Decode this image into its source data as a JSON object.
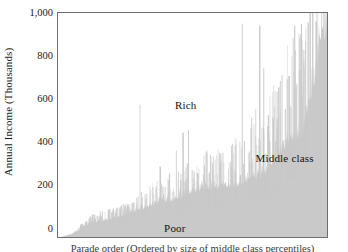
{
  "chart_data": {
    "type": "area",
    "title": "",
    "subtitle": "",
    "xlabel": "",
    "ylabel": "Annual Income (Thousands)",
    "ylim": [
      0,
      1050
    ],
    "yticks": [
      0,
      200,
      400,
      600,
      800,
      1000
    ],
    "ytick_labels": [
      "0",
      "200",
      "400",
      "600",
      "800",
      "1,000"
    ],
    "xlim": [
      0,
      100
    ],
    "xticks": [],
    "xtick_labels": [],
    "grid": false,
    "legend_position": "none",
    "series_fill_color": "#c9c9c9",
    "frame_color": "#6e6e6e",
    "annotations": [
      {
        "label": "Rich",
        "x_pct": 47.5,
        "y_value": 620
      },
      {
        "label": "Middle class",
        "x_pct": 84.0,
        "y_value": 370
      },
      {
        "label": "Poor",
        "x_pct": 43.5,
        "y_value": 45
      }
    ],
    "envelope": {
      "comment": "Upper silhouette of the shaded mass, sampled as (x_pct, income_thousands) pairs.",
      "points": [
        [
          0.0,
          0
        ],
        [
          1.5,
          2
        ],
        [
          3.0,
          6
        ],
        [
          4.5,
          12
        ],
        [
          6.0,
          22
        ],
        [
          7.5,
          38
        ],
        [
          9.0,
          55
        ],
        [
          10.5,
          70
        ],
        [
          12.0,
          80
        ],
        [
          13.5,
          88
        ],
        [
          15.0,
          92
        ],
        [
          17.0,
          95
        ],
        [
          19.0,
          100
        ],
        [
          21.0,
          105
        ],
        [
          23.0,
          112
        ],
        [
          25.0,
          120
        ],
        [
          27.0,
          128
        ],
        [
          29.0,
          138
        ],
        [
          31.0,
          150
        ],
        [
          33.0,
          162
        ],
        [
          35.0,
          172
        ],
        [
          37.0,
          180
        ],
        [
          39.0,
          185
        ],
        [
          41.0,
          190
        ],
        [
          43.0,
          196
        ],
        [
          45.0,
          202
        ],
        [
          47.0,
          212
        ],
        [
          49.0,
          228
        ],
        [
          51.0,
          240
        ],
        [
          53.0,
          245
        ],
        [
          55.0,
          248
        ],
        [
          57.0,
          250
        ],
        [
          59.0,
          252
        ],
        [
          61.0,
          254
        ],
        [
          63.0,
          258
        ],
        [
          65.0,
          262
        ],
        [
          67.0,
          268
        ],
        [
          69.0,
          278
        ],
        [
          71.0,
          292
        ],
        [
          73.0,
          300
        ],
        [
          75.0,
          310
        ],
        [
          77.0,
          330
        ],
        [
          79.0,
          360
        ],
        [
          81.0,
          400
        ],
        [
          83.0,
          430
        ],
        [
          85.0,
          470
        ],
        [
          87.0,
          500
        ],
        [
          89.0,
          500
        ],
        [
          91.0,
          510
        ],
        [
          92.5,
          620
        ],
        [
          93.5,
          700
        ],
        [
          94.5,
          745
        ],
        [
          95.5,
          760
        ],
        [
          96.5,
          880
        ],
        [
          97.2,
          960
        ],
        [
          97.8,
          1000
        ],
        [
          98.4,
          1010
        ],
        [
          99.0,
          1030
        ],
        [
          99.6,
          1050
        ]
      ]
    },
    "spikes": {
      "comment": "Notable tall vertical spikes rising above the silhouette (x_pct, peak income thousands).",
      "points": [
        [
          30.5,
          620
        ],
        [
          38.0,
          330
        ],
        [
          41.5,
          300
        ],
        [
          44.0,
          405
        ],
        [
          46.5,
          490
        ],
        [
          48.5,
          500
        ],
        [
          52.0,
          300
        ],
        [
          55.0,
          250
        ],
        [
          58.0,
          260
        ],
        [
          62.0,
          250
        ],
        [
          66.0,
          305
        ],
        [
          68.5,
          1000
        ],
        [
          70.5,
          300
        ],
        [
          72.0,
          560
        ],
        [
          73.5,
          600
        ],
        [
          75.0,
          990
        ],
        [
          76.5,
          790
        ],
        [
          78.0,
          520
        ],
        [
          80.0,
          560
        ],
        [
          82.0,
          700
        ],
        [
          84.5,
          600
        ],
        [
          86.0,
          755
        ],
        [
          88.0,
          990
        ],
        [
          90.5,
          1000
        ],
        [
          93.0,
          1005
        ],
        [
          96.0,
          1010
        ],
        [
          98.0,
          1050
        ]
      ]
    }
  },
  "chart": {
    "ylabel": "Annual Income (Thousands)",
    "ytick_labels": [
      "1,000",
      "800",
      "600",
      "400",
      "200",
      "0"
    ],
    "annotation_rich": "Rich",
    "annotation_middle": "Middle class",
    "annotation_poor": "Poor"
  },
  "caption": {
    "text": "Parade order (Ordered by size of middle class percentiles)"
  }
}
